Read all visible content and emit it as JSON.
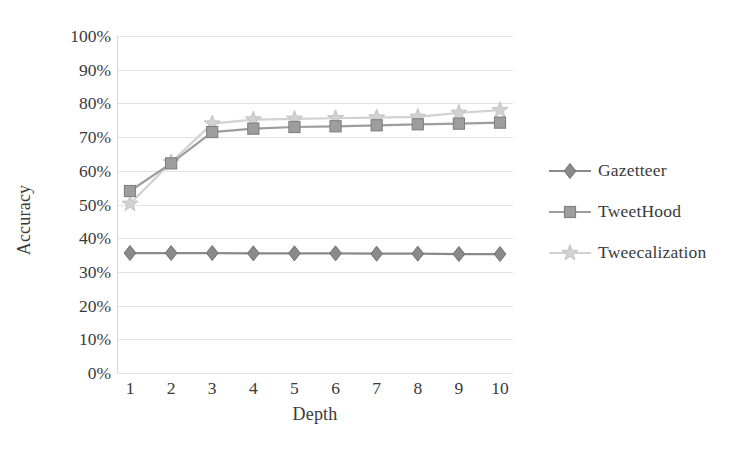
{
  "chart_data": {
    "type": "line",
    "title": "",
    "xlabel": "Depth",
    "ylabel": "Accuracy",
    "x": [
      1,
      2,
      3,
      4,
      5,
      6,
      7,
      8,
      9,
      10
    ],
    "xtick_labels": [
      "1",
      "2",
      "3",
      "4",
      "5",
      "6",
      "7",
      "8",
      "9",
      "10"
    ],
    "ytick_labels": [
      "0%",
      "10%",
      "20%",
      "30%",
      "40%",
      "50%",
      "60%",
      "70%",
      "80%",
      "90%",
      "100%"
    ],
    "ytick_values": [
      0,
      10,
      20,
      30,
      40,
      50,
      60,
      70,
      80,
      90,
      100
    ],
    "ylim": [
      0,
      100
    ],
    "xlim": [
      1,
      10
    ],
    "grid": true,
    "grid_axis": "y",
    "legend_position": "right",
    "value_unit": "percent",
    "series": [
      {
        "name": "Gazetteer",
        "marker": "diamond",
        "color": "#8a8a8a",
        "values": [
          35.6,
          35.6,
          35.6,
          35.5,
          35.5,
          35.5,
          35.4,
          35.4,
          35.3,
          35.3
        ]
      },
      {
        "name": "TweetHood",
        "marker": "square",
        "color": "#9d9d9d",
        "values": [
          54.0,
          62.2,
          71.5,
          72.5,
          73.0,
          73.2,
          73.5,
          73.8,
          74.0,
          74.3
        ]
      },
      {
        "name": "Tweecalization",
        "marker": "star",
        "color": "#d2d2d2",
        "values": [
          50.2,
          62.5,
          74.0,
          75.2,
          75.4,
          75.6,
          75.8,
          76.0,
          77.2,
          78.0
        ]
      }
    ]
  },
  "legend": {
    "items": [
      {
        "label": "Gazetteer",
        "marker": "diamond",
        "color": "#8a8a8a"
      },
      {
        "label": "TweetHood",
        "marker": "square",
        "color": "#9d9d9d"
      },
      {
        "label": "Tweecalization",
        "marker": "star",
        "color": "#d2d2d2"
      }
    ]
  },
  "axes": {
    "y_title": "Accuracy",
    "x_title": "Depth"
  }
}
